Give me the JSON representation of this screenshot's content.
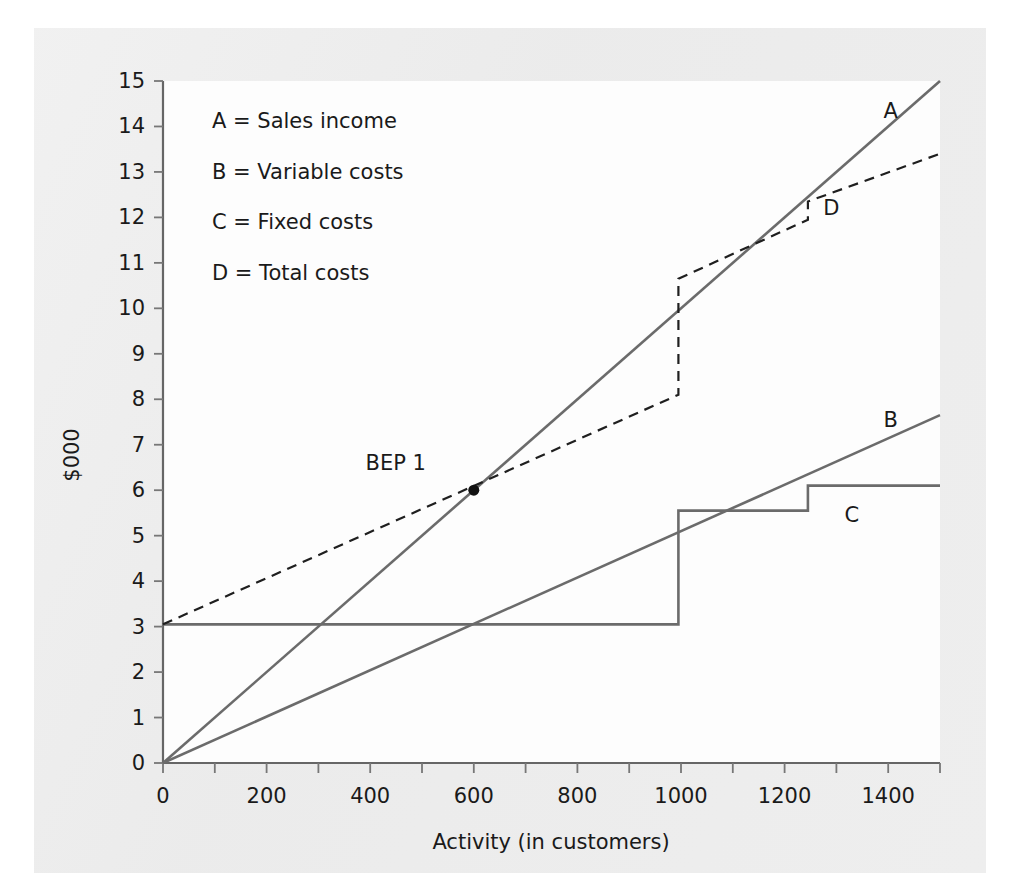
{
  "page": {
    "background_color": "#ffffff",
    "paper_color": "#eeeeee",
    "plot_background_color": "#fdfdfd"
  },
  "chart_data": {
    "type": "line",
    "title": "",
    "xlabel": "Activity (in customers)",
    "ylabel": "$000",
    "xlim": [
      0,
      1500
    ],
    "ylim": [
      0,
      15
    ],
    "grid": false,
    "legend_position": "upper-left-inside",
    "x_ticks_major": [
      0,
      200,
      400,
      600,
      800,
      1000,
      1200,
      1400
    ],
    "x_ticks_minor": [
      100,
      300,
      500,
      700,
      900,
      1100,
      1300,
      1500
    ],
    "x_tick_labels": [
      "0",
      "200",
      "400",
      "600",
      "800",
      "1000",
      "1200",
      "1400"
    ],
    "y_ticks": [
      0,
      1,
      2,
      3,
      4,
      5,
      6,
      7,
      8,
      9,
      10,
      11,
      12,
      13,
      14,
      15
    ],
    "y_tick_labels": [
      "0",
      "1",
      "2",
      "3",
      "4",
      "5",
      "6",
      "7",
      "8",
      "9",
      "10",
      "11",
      "12",
      "13",
      "14",
      "15"
    ],
    "line_color": "#6b6b6b",
    "dashed_line_color": "#1f1f1f",
    "series": [
      {
        "key": "A",
        "name": "Sales income",
        "legend_label": "A  =  Sales income",
        "style": "solid",
        "label": "A",
        "label_at": {
          "x": 1405,
          "y": 14.35
        },
        "points": [
          [
            0,
            0
          ],
          [
            1500,
            15.0
          ]
        ]
      },
      {
        "key": "B",
        "name": "Variable costs",
        "legend_label": "B  =  Variable costs",
        "style": "solid",
        "label": "B",
        "label_at": {
          "x": 1405,
          "y": 7.55
        },
        "points": [
          [
            0,
            0
          ],
          [
            1500,
            7.65
          ]
        ]
      },
      {
        "key": "C",
        "name": "Fixed costs",
        "legend_label": "C  =  Fixed costs",
        "style": "solid-step",
        "label": "C",
        "label_at": {
          "x": 1330,
          "y": 5.45
        },
        "points": [
          [
            0,
            3.05
          ],
          [
            995,
            3.05
          ],
          [
            995,
            5.55
          ],
          [
            1245,
            5.55
          ],
          [
            1245,
            6.1
          ],
          [
            1500,
            6.1
          ]
        ]
      },
      {
        "key": "D",
        "name": "Total costs",
        "legend_label": "D  =  Total costs",
        "style": "dashed-step",
        "label": "D",
        "label_at": {
          "x": 1290,
          "y": 12.2
        },
        "points": [
          [
            0,
            3.05
          ],
          [
            995,
            8.1
          ],
          [
            995,
            10.65
          ],
          [
            1245,
            11.95
          ],
          [
            1245,
            12.35
          ],
          [
            1500,
            13.4
          ]
        ]
      }
    ],
    "annotations": [
      {
        "key": "bep1",
        "label": "BEP 1",
        "marker": "dot",
        "x": 600,
        "y": 6.0,
        "label_offset": {
          "dx": -78,
          "dy": -20
        }
      }
    ],
    "legend_entries": [
      "A  =  Sales income",
      "B  =  Variable costs",
      "C  =  Fixed costs",
      "D  =  Total costs"
    ]
  }
}
